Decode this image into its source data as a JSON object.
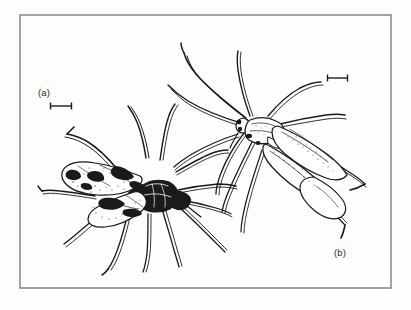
{
  "figure": {
    "kind": "scientific-illustration-plate",
    "medium": "black-and-white line drawing",
    "background_color": "#fdfdfd",
    "ink_color": "#1a1a1a",
    "frame": {
      "name": "plate-border",
      "color": "#8c8c8c",
      "stroke_width": 1.6,
      "x": 20,
      "y": 15,
      "width": 371,
      "height": 273
    },
    "panels": [
      {
        "id": "a",
        "label": "(a)",
        "label_x": 38,
        "label_y": 96,
        "description": "Dark, broad-bodied bug with heavily mottled black-and-white forewings, oriented diagonally with head toward lower right.",
        "scale_bar": {
          "name": "scale-bar-a",
          "x1": 50,
          "x2": 72,
          "y": 106,
          "cap_height": 7
        }
      },
      {
        "id": "b",
        "label": "(b)",
        "label_x": 334,
        "label_y": 256,
        "description": "Paler, slender bug with finely stippled forewings and long thin legs and antennae, oriented diagonally with head toward lower left.",
        "scale_bar": {
          "name": "scale-bar-b",
          "x1": 327,
          "x2": 348,
          "y": 78,
          "cap_height": 7
        }
      }
    ]
  },
  "colors": {
    "ink": "#1a1a1a",
    "frame": "#8c8c8c",
    "paper": "#fdfdfd",
    "label_text": "#2b2b2b"
  }
}
